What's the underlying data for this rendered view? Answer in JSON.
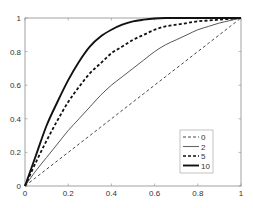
{
  "chart_data": {
    "type": "line",
    "title": "",
    "xlabel": "",
    "ylabel": "",
    "xlim": [
      0,
      1
    ],
    "ylim": [
      0,
      1
    ],
    "grid": false,
    "legend_position": "lower right (inside axes)",
    "x_ticks": [
      "0",
      "0.2",
      "0.4",
      "0.6",
      "0.8",
      "1"
    ],
    "y_ticks": [
      "0",
      "0.2",
      "0.4",
      "0.6",
      "0.8",
      "1"
    ],
    "x": [
      0,
      0.05,
      0.1,
      0.15,
      0.2,
      0.25,
      0.3,
      0.35,
      0.4,
      0.45,
      0.5,
      0.55,
      0.6,
      0.65,
      0.7,
      0.75,
      0.8,
      0.85,
      0.9,
      0.95,
      1.0
    ],
    "series": [
      {
        "name": "0",
        "style": "dashed-thin",
        "color": "#333333",
        "values": [
          0,
          0.05,
          0.1,
          0.15,
          0.2,
          0.25,
          0.3,
          0.35,
          0.4,
          0.45,
          0.5,
          0.55,
          0.6,
          0.65,
          0.7,
          0.75,
          0.8,
          0.85,
          0.9,
          0.95,
          1.0
        ]
      },
      {
        "name": "2",
        "style": "solid-thin",
        "color": "#444444",
        "values": [
          0,
          0.09,
          0.17,
          0.25,
          0.33,
          0.4,
          0.47,
          0.54,
          0.6,
          0.65,
          0.7,
          0.75,
          0.8,
          0.84,
          0.87,
          0.9,
          0.93,
          0.95,
          0.97,
          0.985,
          1.0
        ]
      },
      {
        "name": "5",
        "style": "dashed-bold",
        "color": "#111111",
        "values": [
          0,
          0.14,
          0.27,
          0.39,
          0.5,
          0.59,
          0.67,
          0.73,
          0.79,
          0.83,
          0.87,
          0.9,
          0.93,
          0.95,
          0.96,
          0.97,
          0.98,
          0.985,
          0.99,
          0.995,
          1.0
        ]
      },
      {
        "name": "10",
        "style": "solid-bold",
        "color": "#111111",
        "values": [
          0,
          0.18,
          0.36,
          0.5,
          0.63,
          0.74,
          0.83,
          0.89,
          0.93,
          0.96,
          0.98,
          0.99,
          0.997,
          1.0,
          1.0,
          1.0,
          1.0,
          1.0,
          1.0,
          1.0,
          1.0
        ]
      }
    ]
  },
  "legend": {
    "entries": [
      {
        "label": "0"
      },
      {
        "label": "2"
      },
      {
        "label": "5"
      },
      {
        "label": "10"
      }
    ]
  },
  "axes": {
    "x_tick_labels": [
      "0",
      "0.2",
      "0.4",
      "0.6",
      "0.8",
      "1"
    ],
    "y_tick_labels": [
      "0",
      "0.2",
      "0.4",
      "0.6",
      "0.8",
      "1"
    ]
  }
}
